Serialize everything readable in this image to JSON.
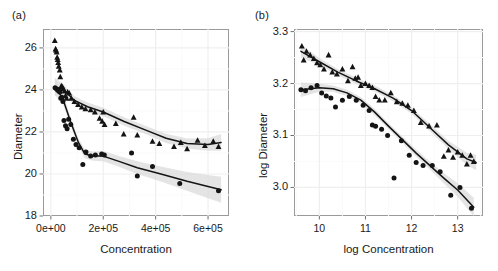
{
  "figure": {
    "background": "#ffffff",
    "grid_color": "#f2f2f2",
    "frame_color": "#9a9a9a",
    "point_color": "#141414",
    "line_color": "#141414",
    "band_color": "#d9d9d9"
  },
  "panels": [
    {
      "id": "a",
      "label": "(a)"
    },
    {
      "id": "b",
      "label": "(b)"
    }
  ],
  "chart_data": [
    {
      "type": "scatter",
      "panel": "(a)",
      "title": "",
      "xlabel": "Concentration",
      "ylabel": "Diameter",
      "xlim": [
        -30000,
        680000
      ],
      "ylim": [
        18,
        26.9
      ],
      "xticks": [
        0,
        200000,
        400000,
        600000
      ],
      "xtick_labels": [
        "0e+00",
        "2e+05",
        "4e+05",
        "6e+05"
      ],
      "yticks": [
        18,
        20,
        22,
        24,
        26
      ],
      "ytick_labels": [
        "18",
        "20",
        "22",
        "24",
        "26"
      ],
      "grid": true,
      "legend": "none",
      "series": [
        {
          "name": "triangles",
          "marker": "triangle",
          "x": [
            15000,
            18000,
            20000,
            22000,
            24000,
            26000,
            28000,
            30000,
            34000,
            36000,
            40000,
            44000,
            48000,
            52000,
            56000,
            60000,
            64000,
            70000,
            78000,
            90000,
            104000,
            118000,
            132000,
            152000,
            168000,
            186000,
            196000,
            200000,
            205000,
            248000,
            278000,
            316000,
            330000,
            388000,
            414000,
            470000,
            496000,
            520000,
            560000,
            588000,
            620000,
            640000
          ],
          "y": [
            26.35,
            25.95,
            25.88,
            25.8,
            25.55,
            25.45,
            25.3,
            25.12,
            24.95,
            24.62,
            24.2,
            24.15,
            24.05,
            23.95,
            23.72,
            23.6,
            23.9,
            23.85,
            23.6,
            23.45,
            23.3,
            23.18,
            23.1,
            23.05,
            22.95,
            22.65,
            22.5,
            22.95,
            22.35,
            22.4,
            21.9,
            22.7,
            21.85,
            21.55,
            21.45,
            21.3,
            21.5,
            21.2,
            21.6,
            21.35,
            21.55,
            21.3
          ],
          "fit_x": [
            15000,
            50000,
            90000,
            140000,
            200000,
            280000,
            360000,
            440000,
            520000,
            600000,
            650000
          ],
          "fit_y": [
            24.15,
            24.0,
            23.5,
            23.2,
            22.95,
            22.5,
            22.1,
            21.7,
            21.45,
            21.4,
            21.5
          ],
          "band_half_width": [
            0.42,
            0.26,
            0.2,
            0.2,
            0.2,
            0.2,
            0.2,
            0.22,
            0.24,
            0.3,
            0.4
          ]
        },
        {
          "name": "circles",
          "marker": "circle",
          "x": [
            16000,
            22000,
            26000,
            30000,
            34000,
            38000,
            42000,
            46000,
            50000,
            56000,
            62000,
            68000,
            76000,
            86000,
            96000,
            108000,
            122000,
            134000,
            152000,
            170000,
            194000,
            204000,
            308000,
            330000,
            388000,
            492000,
            640000
          ],
          "y": [
            24.1,
            24.05,
            24.0,
            23.95,
            23.9,
            23.6,
            23.65,
            23.45,
            22.55,
            22.3,
            22.15,
            22.6,
            22.35,
            21.65,
            21.4,
            21.25,
            20.45,
            21.05,
            20.85,
            20.9,
            20.95,
            20.9,
            21.0,
            19.9,
            20.35,
            19.55,
            19.2
          ],
          "fit_x": [
            16000,
            45000,
            75000,
            105000,
            130000,
            160000,
            200000,
            260000,
            330000,
            420000,
            520000,
            600000,
            650000
          ],
          "fit_y": [
            24.15,
            23.6,
            22.5,
            21.5,
            20.95,
            20.85,
            20.85,
            20.6,
            20.3,
            20.0,
            19.65,
            19.4,
            19.25
          ],
          "band_half_width": [
            0.4,
            0.25,
            0.2,
            0.2,
            0.2,
            0.22,
            0.24,
            0.26,
            0.3,
            0.36,
            0.45,
            0.55,
            0.62
          ]
        }
      ]
    },
    {
      "type": "scatter",
      "panel": "(b)",
      "title": "",
      "xlabel": "log Concentration",
      "ylabel": "log Diameter",
      "xlim": [
        9.45,
        13.55
      ],
      "ylim": [
        2.945,
        3.305
      ],
      "xticks": [
        10,
        11,
        12,
        13
      ],
      "xtick_labels": [
        "10",
        "11",
        "12",
        "13"
      ],
      "yticks": [
        3.0,
        3.1,
        3.2,
        3.3
      ],
      "ytick_labels": [
        "3.0",
        "3.1",
        "3.2",
        "3.3"
      ],
      "grid": true,
      "legend": "none",
      "series": [
        {
          "name": "triangles",
          "marker": "triangle",
          "x": [
            9.62,
            9.66,
            9.72,
            9.8,
            9.88,
            9.95,
            10.02,
            10.1,
            10.2,
            10.28,
            10.38,
            10.5,
            10.62,
            10.72,
            10.78,
            10.84,
            10.9,
            11.0,
            11.08,
            11.15,
            11.22,
            11.3,
            11.42,
            11.55,
            11.68,
            11.8,
            11.92,
            12.05,
            12.2,
            12.38,
            12.55,
            12.7,
            12.8,
            12.9,
            13.0,
            13.1,
            13.2,
            13.28,
            13.35
          ],
          "y": [
            3.272,
            3.245,
            3.262,
            3.255,
            3.248,
            3.24,
            3.236,
            3.228,
            3.255,
            3.222,
            3.218,
            3.228,
            3.205,
            3.232,
            3.21,
            3.212,
            3.196,
            3.2,
            3.196,
            3.192,
            3.175,
            3.168,
            3.168,
            3.182,
            3.165,
            3.162,
            3.158,
            3.148,
            3.125,
            3.118,
            3.12,
            3.06,
            3.072,
            3.058,
            3.068,
            3.062,
            3.045,
            3.062,
            3.05
          ],
          "fit_x": [
            9.6,
            10.0,
            10.4,
            10.8,
            11.2,
            11.6,
            12.0,
            12.4,
            12.8,
            13.2,
            13.4
          ],
          "fit_y": [
            3.262,
            3.242,
            3.222,
            3.205,
            3.19,
            3.172,
            3.148,
            3.115,
            3.082,
            3.055,
            3.048
          ],
          "band_half_width": [
            0.012,
            0.007,
            0.006,
            0.006,
            0.006,
            0.006,
            0.006,
            0.007,
            0.008,
            0.012,
            0.015
          ]
        },
        {
          "name": "circles",
          "marker": "circle",
          "x": [
            9.6,
            9.7,
            9.82,
            9.95,
            10.05,
            10.15,
            10.25,
            10.35,
            10.5,
            10.65,
            10.8,
            10.95,
            11.08,
            11.15,
            11.22,
            11.35,
            11.48,
            11.62,
            11.78,
            11.95,
            12.1,
            12.25,
            12.45,
            12.62,
            12.85,
            13.05,
            13.3
          ],
          "y": [
            3.188,
            3.186,
            3.192,
            3.196,
            3.182,
            3.176,
            3.172,
            3.155,
            3.168,
            3.175,
            3.168,
            3.158,
            3.148,
            3.12,
            3.118,
            3.112,
            3.1,
            3.018,
            3.09,
            3.062,
            3.048,
            3.042,
            3.042,
            3.03,
            2.985,
            3.0,
            2.96
          ],
          "fit_x": [
            9.6,
            10.0,
            10.3,
            10.6,
            10.9,
            11.2,
            11.5,
            11.8,
            12.1,
            12.4,
            12.7,
            13.0,
            13.35
          ],
          "fit_y": [
            3.188,
            3.192,
            3.19,
            3.182,
            3.168,
            3.145,
            3.118,
            3.092,
            3.066,
            3.042,
            3.018,
            2.995,
            2.962
          ],
          "band_half_width": [
            0.014,
            0.008,
            0.006,
            0.006,
            0.006,
            0.006,
            0.006,
            0.006,
            0.007,
            0.008,
            0.01,
            0.013,
            0.018
          ]
        }
      ]
    }
  ]
}
